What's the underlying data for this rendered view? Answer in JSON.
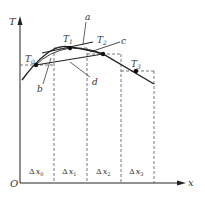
{
  "diagram": {
    "axes": {
      "y_label": "T",
      "x_label": "x",
      "origin_label": "O"
    },
    "points": [
      {
        "label": "T",
        "sub": "0",
        "x": 36,
        "y": 65
      },
      {
        "label": "T",
        "sub": "1",
        "x": 70,
        "y": 48
      },
      {
        "label": "T",
        "sub": "2",
        "x": 103,
        "y": 54
      },
      {
        "label": "T",
        "sub": "3",
        "x": 136,
        "y": 71
      }
    ],
    "line_labels": {
      "a": "a",
      "b": "b",
      "c": "c",
      "d": "d"
    },
    "intervals": [
      {
        "label": "Δ",
        "var": "x",
        "sub": "0"
      },
      {
        "label": "Δ",
        "var": "x",
        "sub": "1"
      },
      {
        "label": "Δ",
        "var": "x",
        "sub": "2"
      },
      {
        "label": "Δ",
        "var": "x",
        "sub": "3"
      }
    ],
    "colors": {
      "line": "#222222",
      "dashed": "#555555",
      "text": "#333333"
    }
  }
}
